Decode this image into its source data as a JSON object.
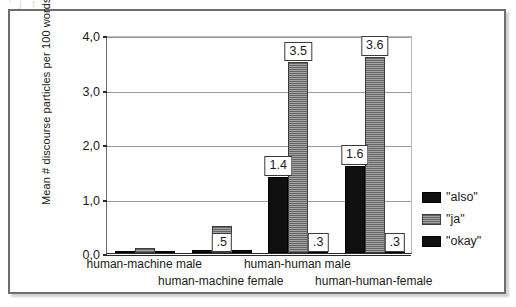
{
  "artifact": {
    "top_smudge": "＇ｊ  ｔ  ｊ"
  },
  "chart_data": {
    "type": "bar",
    "title": "",
    "xlabel": "",
    "ylabel": "Mean # discourse particles per 100 words",
    "ylim": [
      0,
      4
    ],
    "ytick_values": [
      0,
      1,
      2,
      3,
      4
    ],
    "ytick_labels": [
      "0,0",
      "1,0",
      "2,0",
      "3,0",
      "4,0"
    ],
    "grid": true,
    "legend_position": "right",
    "categories": [
      "human-machine male",
      "human-machine female",
      "human-human male",
      "human-human-female"
    ],
    "series": [
      {
        "name": "\"also\"",
        "color": "#101010",
        "values": [
          0.02,
          0.05,
          1.4,
          1.6
        ],
        "labels": [
          "",
          "",
          "1.4",
          "1.6"
        ]
      },
      {
        "name": "\"ja\"",
        "color": "#8c8c8c",
        "values": [
          0.1,
          0.5,
          3.5,
          3.6
        ],
        "labels": [
          "",
          ".5",
          "3.5",
          "3.6"
        ]
      },
      {
        "name": "\"okay\"",
        "color": "#101010",
        "values": [
          0.02,
          0.05,
          0.3,
          0.3
        ],
        "labels": [
          "",
          "",
          ".3",
          ".3"
        ]
      }
    ]
  }
}
